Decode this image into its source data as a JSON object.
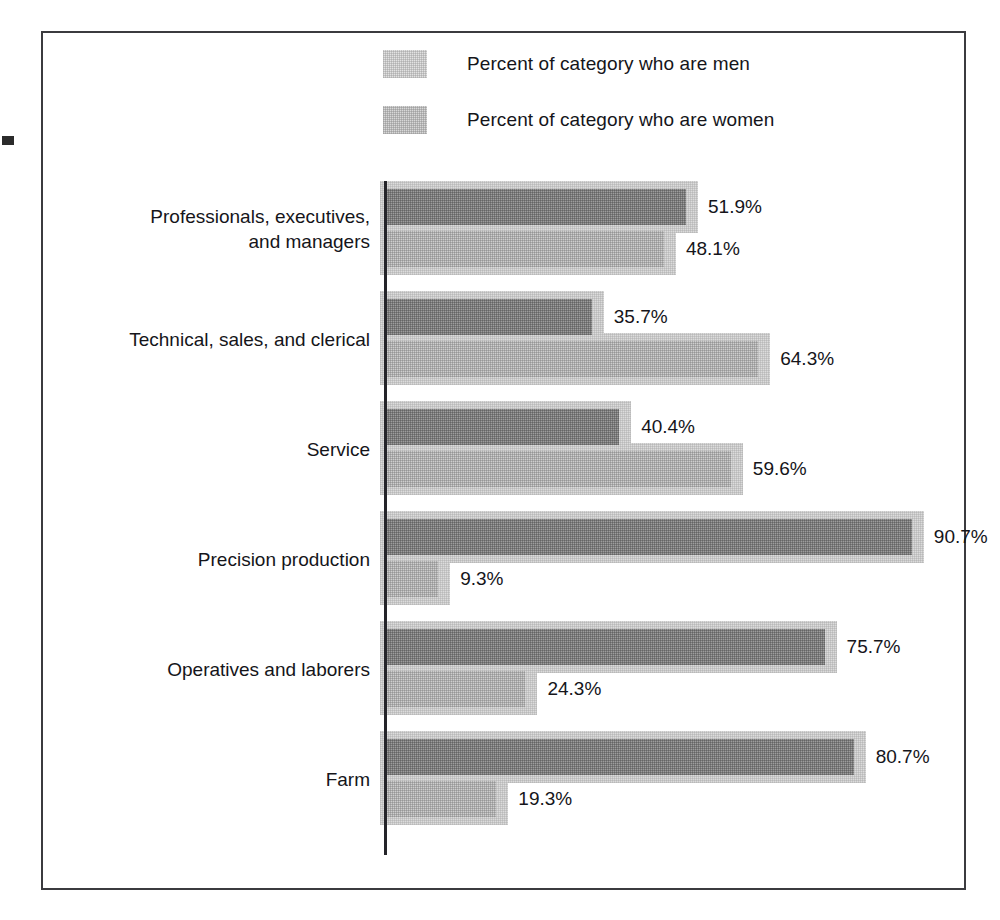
{
  "figure": {
    "frame_color": "#3b3b3f",
    "background": "#ffffff"
  },
  "legend": {
    "position": "top-center",
    "items": [
      {
        "key": "men",
        "label": "Percent of category who are men",
        "swatch_color": "#e2e2e2"
      },
      {
        "key": "women",
        "label": "Percent of category who are women",
        "swatch_color": "#d8d8d8"
      }
    ]
  },
  "chart_data": {
    "type": "bar",
    "orientation": "horizontal",
    "grouped": true,
    "title": "",
    "subtitle": "",
    "xlabel": "",
    "ylabel": "",
    "xlim": [
      0,
      100
    ],
    "grid": false,
    "legend_position": "top-center",
    "value_suffix": "%",
    "categories": [
      "Professionals, executives,\nand managers",
      "Technical, sales, and clerical",
      "Service",
      "Precision production",
      "Operatives and laborers",
      "Farm"
    ],
    "series": [
      {
        "name": "Percent of category who are men",
        "color": "#9d9d9d",
        "values": [
          51.9,
          35.7,
          40.4,
          90.7,
          75.7,
          80.7
        ],
        "labels": [
          "51.9%",
          "35.7%",
          "40.4%",
          "90.7%",
          "75.7%",
          "80.7%"
        ]
      },
      {
        "name": "Percent of category who are women",
        "color": "#cecece",
        "values": [
          48.1,
          64.3,
          59.6,
          9.3,
          24.3,
          19.3
        ],
        "labels": [
          "48.1%",
          "64.3%",
          "59.6%",
          "9.3%",
          "24.3%",
          "19.3%"
        ]
      }
    ]
  }
}
